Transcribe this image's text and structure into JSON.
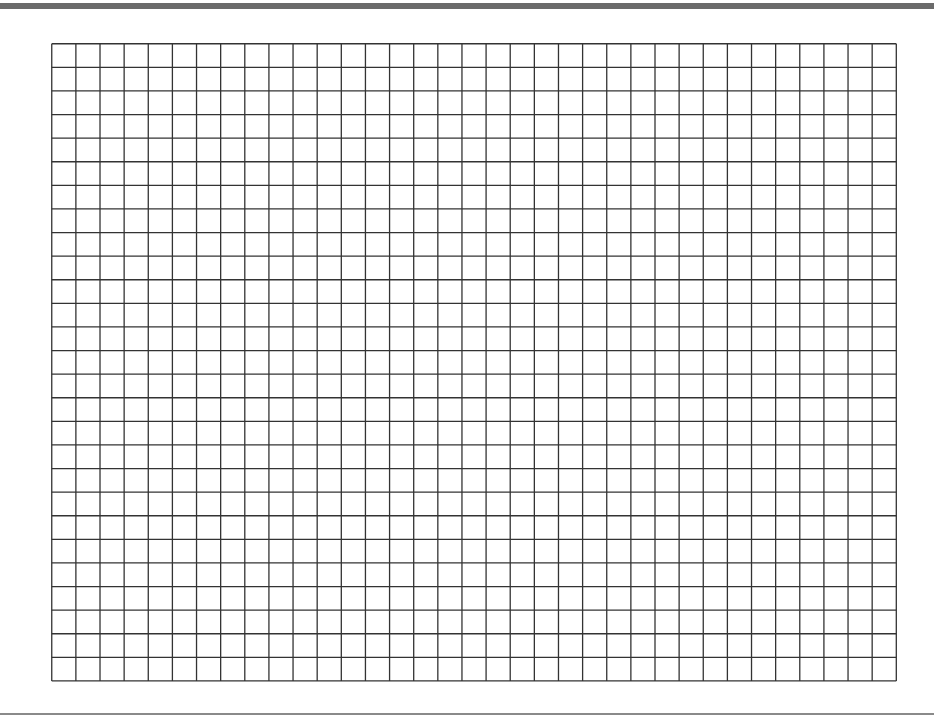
{
  "sheet": {
    "type": "graph-paper",
    "columns": 35,
    "rows": 27,
    "cell_width": 24.13,
    "cell_height": 23.6,
    "line_color": "#333333",
    "top_rule_color": "#6b6b6b",
    "bottom_rule_color": "#8a8a8a"
  }
}
